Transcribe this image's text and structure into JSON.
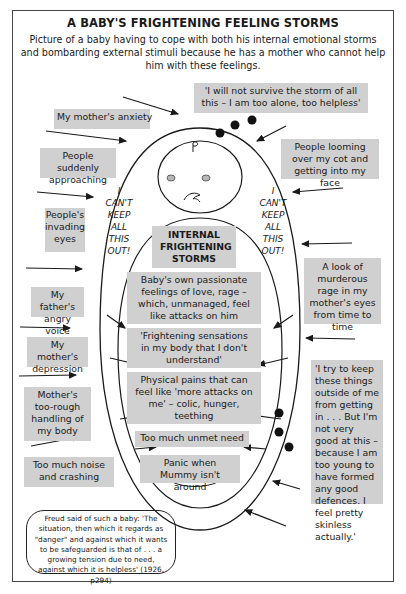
{
  "header": {
    "title": "A BABY'S FRIGHTENING FEELING STORMS",
    "subtitle": "Picture of a baby having to cope with both his internal emotional storms and bombarding external stimuli because he has a mother who cannot help him with these feelings."
  },
  "external_stimuli": {
    "top_quote": "'I will not survive the storm of all this – I am too alone, too helpless'",
    "left": [
      "My mother's anxiety",
      "People suddenly approaching",
      "People's invading eyes",
      "My father's angry voice",
      "My mother's depression",
      "Mother's too-rough handling of my body",
      "Too much noise and crashing"
    ],
    "right": [
      "People looming over my cot and getting into my face",
      "A look of murderous rage in my mother's eyes from time to time",
      "'I try to keep these things outside of me from getting in . . . But I'm not very good at this – because I am too young to have formed any good defences. I feel pretty skinless actually.'"
    ]
  },
  "baby_figure": {
    "cant_keep_left": "I CAN'T KEEP ALL THIS OUT!",
    "cant_keep_right": "I CAN'T KEEP ALL THIS OUT!",
    "internal_heading": "INTERNAL FRIGHTENING STORMS",
    "internal_items": [
      "Baby's own passionate feelings of love, rage – which, unmanaged, feel like attacks on him",
      "'Frightening sensations in my body that I don't understand'",
      "Physical pains that can feel like 'more attacks on me' – colic, hunger, teething",
      "Too much unmet need",
      "Panic when Mummy isn't around"
    ]
  },
  "freud_quote": "Freud said of such a baby: 'The situation, then which it regards as \"danger\" and against which it wants to be safeguarded is that of . . . a growing tension due to need, against which it is helpless' (1926, p294)",
  "colors": {
    "box_fill": "#d0d0d0",
    "line": "#1a1a1a"
  }
}
